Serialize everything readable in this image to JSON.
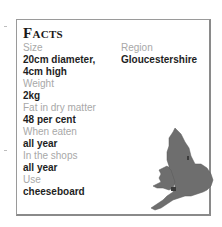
{
  "facts": {
    "title": "Facts",
    "left_column": [
      {
        "label": "Size",
        "value_lines": [
          "20cm diameter,",
          "4cm high"
        ]
      },
      {
        "label": "Weight",
        "value_lines": [
          "2kg"
        ]
      },
      {
        "label": "Fat in dry matter",
        "value_lines": [
          "48 per cent"
        ]
      },
      {
        "label": "When eaten",
        "value_lines": [
          "all year"
        ]
      },
      {
        "label": "In the shops",
        "value_lines": [
          "all year"
        ]
      },
      {
        "label": "Use",
        "value_lines": [
          "cheeseboard"
        ]
      }
    ],
    "right_column": [
      {
        "label": "Region",
        "value_lines": [
          "Gloucestershire"
        ]
      }
    ],
    "map": {
      "icon": "england-wales-map-icon",
      "fill_color": "#6e6e6e",
      "marker_color": "#3a3a3a"
    }
  },
  "colors": {
    "label": "#a8a8a8",
    "value": "#1e1e1e",
    "border": "#9a9a9a"
  }
}
